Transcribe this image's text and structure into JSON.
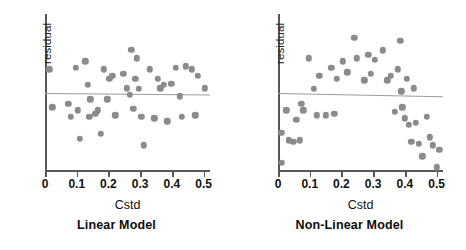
{
  "figure": {
    "background": "#ffffff",
    "dot_color": "#8b8b8d",
    "axis_color": "#58585a",
    "refline_color": "#9b9b9d"
  },
  "chart_data": [
    {
      "type": "scatter",
      "title": "Linear Model",
      "xlabel": "Cstd",
      "ylabel": "residual",
      "xlim": [
        0.0,
        0.52
      ],
      "ylim": [
        -1.0,
        1.0
      ],
      "xticks": [
        0,
        0.1,
        0.2,
        0.3,
        0.4,
        0.5
      ],
      "xticklabels": [
        "0",
        "0.1",
        "0.2",
        "0.3",
        "0.4",
        "0.5"
      ],
      "yticks": [],
      "grid": false,
      "legend": "none",
      "annotations": [
        "horizontal reference line at residual = 0"
      ],
      "reference_line": {
        "y": 0.0,
        "slope": -0.02
      },
      "x": [
        0.013,
        0.023,
        0.073,
        0.082,
        0.098,
        0.104,
        0.11,
        0.127,
        0.134,
        0.14,
        0.143,
        0.158,
        0.167,
        0.175,
        0.185,
        0.196,
        0.203,
        0.212,
        0.222,
        0.247,
        0.258,
        0.268,
        0.272,
        0.278,
        0.285,
        0.289,
        0.296,
        0.304,
        0.312,
        0.33,
        0.345,
        0.355,
        0.363,
        0.375,
        0.385,
        0.398,
        0.412,
        0.424,
        0.432,
        0.444,
        0.462,
        0.474,
        0.482,
        0.503
      ],
      "y": [
        0.3,
        -0.18,
        -0.14,
        -0.3,
        0.32,
        -0.22,
        -0.58,
        0.4,
        0.1,
        -0.3,
        -0.08,
        -0.26,
        -0.22,
        -0.52,
        0.3,
        -0.08,
        0.18,
        0.22,
        -0.28,
        0.24,
        0.06,
        -0.02,
        0.55,
        -0.2,
        0.18,
        0.44,
        0.05,
        -0.3,
        -0.66,
        0.3,
        -0.32,
        0.18,
        0.06,
        0.1,
        -0.36,
        0.12,
        0.32,
        -0.04,
        -0.3,
        0.34,
        0.3,
        -0.28,
        0.22,
        0.06
      ]
    },
    {
      "type": "scatter",
      "title": "Non-Linear Model",
      "xlabel": "Cstd",
      "ylabel": "residual",
      "xlim": [
        0.0,
        0.52
      ],
      "ylim": [
        -1.0,
        1.0
      ],
      "xticks": [
        0,
        0.1,
        0.2,
        0.3,
        0.4,
        0.5
      ],
      "xticklabels": [
        "0",
        "0.1",
        "0.2",
        "0.3",
        "0.4",
        "0.5"
      ],
      "yticks": [],
      "grid": false,
      "legend": "none",
      "annotations": [
        "horizontal reference line at residual = 0",
        "residuals follow a curved (inverted-U) pattern indicating lack of fit"
      ],
      "reference_line": {
        "y": 0.0,
        "slope": -0.04
      },
      "x": [
        0.01,
        0.012,
        0.026,
        0.035,
        0.048,
        0.058,
        0.068,
        0.073,
        0.08,
        0.098,
        0.112,
        0.122,
        0.13,
        0.15,
        0.168,
        0.178,
        0.186,
        0.205,
        0.218,
        0.24,
        0.248,
        0.272,
        0.285,
        0.292,
        0.305,
        0.33,
        0.345,
        0.355,
        0.368,
        0.378,
        0.385,
        0.388,
        0.392,
        0.4,
        0.406,
        0.412,
        0.42,
        0.428,
        0.434,
        0.444,
        0.455,
        0.468,
        0.478,
        0.488,
        0.5,
        0.508
      ],
      "y": [
        -0.5,
        -0.88,
        -0.22,
        -0.6,
        -0.62,
        -0.34,
        -0.6,
        -0.14,
        -0.22,
        0.44,
        0.05,
        -0.28,
        0.22,
        -0.28,
        0.32,
        -0.26,
        0.18,
        0.4,
        0.26,
        0.7,
        0.44,
        0.16,
        0.48,
        0.24,
        0.42,
        0.54,
        0.16,
        0.22,
        -0.24,
        0.3,
        0.66,
        0.02,
        -0.18,
        -0.32,
        0.18,
        -0.4,
        -0.62,
        0.06,
        -0.38,
        -0.64,
        -0.8,
        -0.3,
        -0.56,
        -0.66,
        -0.94,
        -0.72
      ]
    }
  ],
  "panels": [
    {
      "id": "linear",
      "caption": "Linear Model",
      "ylabel": "residual",
      "xlabel": "Cstd",
      "xticklabels": [
        "0",
        "0.1",
        "0.2",
        "0.3",
        "0.4",
        "0.5"
      ]
    },
    {
      "id": "nonlinear",
      "caption": "Non-Linear Model",
      "ylabel": "residual",
      "xlabel": "Cstd",
      "xticklabels": [
        "0",
        "0.1",
        "0.2",
        "0.3",
        "0.4",
        "0.5"
      ]
    }
  ]
}
